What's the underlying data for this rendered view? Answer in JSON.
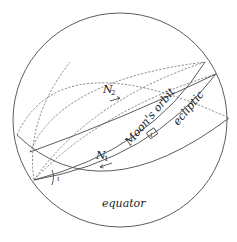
{
  "figure": {
    "labels": {
      "equator": "equator",
      "ecliptic": "ecliptic",
      "moon_orbit": "Moon's orbit",
      "node1_main": "N",
      "node1_sub": "1",
      "node2_main": "N",
      "node2_sub": "2",
      "angle_equator_ecliptic": "ι",
      "angle_orbit_ecliptic": "ι"
    },
    "colors": {
      "line": "#4a4a4a",
      "text": "#222222",
      "background": "#ffffff"
    }
  }
}
